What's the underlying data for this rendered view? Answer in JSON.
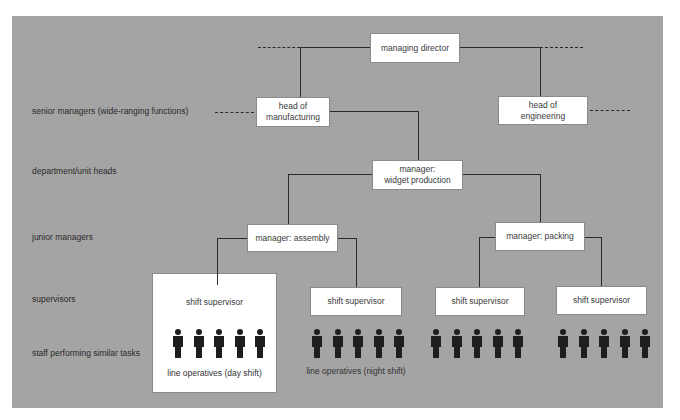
{
  "diagram": {
    "type": "organisation-hierarchy",
    "colors": {
      "panel": "#a4a4a4",
      "box": "#ffffff",
      "line": "#2a2a2a",
      "person": "#1e1e1e"
    },
    "row_labels": [
      "senior managers (wide-ranging functions)",
      "department/unit heads",
      "junior managers",
      "supervisors",
      "staff performing similar tasks"
    ],
    "nodes": {
      "managing_director": "managing director",
      "head_manufacturing_l1": "head of",
      "head_manufacturing_l2": "manufacturing",
      "head_engineering_l1": "head of",
      "head_engineering_l2": "engineering",
      "widget_production_l1": "manager:",
      "widget_production_l2": "widget production",
      "assembly": "manager: assembly",
      "packing": "manager: packing",
      "supervisor_day": "shift supervisor",
      "supervisor_night": "shift supervisor",
      "supervisor_pack_1": "shift supervisor",
      "supervisor_pack_2": "shift supervisor"
    },
    "staff_groups": [
      {
        "caption": "line operatives (day shift)",
        "count": 5
      },
      {
        "caption": "line operatives (night shift)",
        "count": 5
      },
      {
        "caption": "",
        "count": 5
      },
      {
        "caption": "",
        "count": 5
      }
    ]
  }
}
